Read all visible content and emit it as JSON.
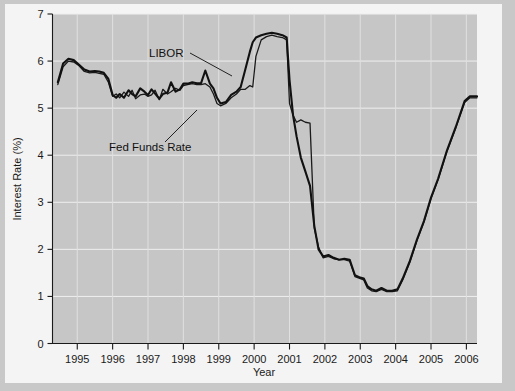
{
  "chart_data": {
    "type": "line",
    "title": "",
    "xlabel": "Year",
    "ylabel": "Interest Rate (%)",
    "xlim": [
      1994.3,
      2006.3
    ],
    "ylim": [
      0,
      7
    ],
    "grid": true,
    "legend_position": "inline-annotations",
    "x_ticks": [
      1995,
      1996,
      1997,
      1998,
      1999,
      2000,
      2001,
      2002,
      2003,
      2004,
      2005,
      2006
    ],
    "x_tick_labels": [
      "1995",
      "1996",
      "1997",
      "1998",
      "1999",
      "2000",
      "2001",
      "2002",
      "2003",
      "2004",
      "2005",
      "2006"
    ],
    "y_ticks": [
      0,
      1,
      2,
      3,
      4,
      5,
      6,
      7
    ],
    "y_tick_labels": [
      "0",
      "1",
      "2",
      "3",
      "4",
      "5",
      "6",
      "7"
    ],
    "annotations": [
      {
        "text": "LIBOR",
        "x": 1997.9,
        "y": 6.27
      },
      {
        "text": "Fed Funds Rate",
        "x": 1996.5,
        "y": 4.43
      }
    ],
    "series": [
      {
        "name": "LIBOR",
        "color": "#111111",
        "x": [
          1994.45,
          1994.6,
          1994.75,
          1994.9,
          1995.05,
          1995.2,
          1995.35,
          1995.5,
          1995.62,
          1995.75,
          1995.88,
          1996.0,
          1996.1,
          1996.2,
          1996.32,
          1996.45,
          1996.55,
          1996.65,
          1996.78,
          1996.9,
          1997.0,
          1997.1,
          1997.2,
          1997.32,
          1997.42,
          1997.55,
          1997.65,
          1997.78,
          1997.9,
          1998.0,
          1998.12,
          1998.25,
          1998.38,
          1998.5,
          1998.62,
          1998.75,
          1998.85,
          1998.95,
          1999.05,
          1999.2,
          1999.35,
          1999.5,
          1999.62,
          1999.75,
          1999.88,
          1999.96,
          2000.05,
          2000.2,
          2000.35,
          2000.5,
          2000.65,
          2000.8,
          2000.92,
          2001.0,
          2001.1,
          2001.2,
          2001.32,
          2001.45,
          2001.58,
          2001.7,
          2001.82,
          2001.95,
          2002.1,
          2002.25,
          2002.4,
          2002.55,
          2002.7,
          2002.85,
          2003.0,
          2003.1,
          2003.2,
          2003.32,
          2003.45,
          2003.6,
          2003.75,
          2003.9,
          2004.05,
          2004.2,
          2004.4,
          2004.6,
          2004.8,
          2005.0,
          2005.2,
          2005.45,
          2005.7,
          2005.95,
          2006.1,
          2006.2,
          2006.3
        ],
        "y": [
          5.55,
          5.95,
          6.05,
          6.02,
          5.92,
          5.82,
          5.78,
          5.79,
          5.78,
          5.75,
          5.62,
          5.28,
          5.22,
          5.3,
          5.22,
          5.38,
          5.3,
          5.25,
          5.42,
          5.35,
          5.28,
          5.4,
          5.31,
          5.2,
          5.3,
          5.33,
          5.55,
          5.35,
          5.4,
          5.52,
          5.52,
          5.55,
          5.53,
          5.53,
          5.8,
          5.52,
          5.42,
          5.22,
          5.1,
          5.13,
          5.28,
          5.35,
          5.45,
          5.82,
          6.2,
          6.4,
          6.5,
          6.55,
          6.58,
          6.6,
          6.58,
          6.55,
          6.5,
          5.6,
          4.85,
          4.4,
          3.95,
          3.65,
          3.35,
          2.5,
          2.0,
          1.85,
          1.88,
          1.82,
          1.78,
          1.8,
          1.78,
          1.45,
          1.4,
          1.38,
          1.22,
          1.15,
          1.12,
          1.18,
          1.12,
          1.12,
          1.15,
          1.38,
          1.75,
          2.2,
          2.6,
          3.1,
          3.5,
          4.1,
          4.6,
          5.15,
          5.25,
          5.25,
          5.25
        ]
      },
      {
        "name": "Fed Funds Rate",
        "color": "#1a1a1a",
        "x": [
          1994.45,
          1994.6,
          1994.75,
          1994.9,
          1995.05,
          1995.2,
          1995.35,
          1995.5,
          1995.62,
          1995.75,
          1995.88,
          1996.0,
          1996.1,
          1996.2,
          1996.32,
          1996.45,
          1996.55,
          1996.65,
          1996.78,
          1996.9,
          1997.0,
          1997.1,
          1997.2,
          1997.32,
          1997.42,
          1997.55,
          1997.65,
          1997.78,
          1997.9,
          1998.0,
          1998.12,
          1998.25,
          1998.38,
          1998.5,
          1998.62,
          1998.75,
          1998.85,
          1998.95,
          1999.05,
          1999.2,
          1999.35,
          1999.5,
          1999.62,
          1999.75,
          1999.88,
          1999.96,
          2000.05,
          2000.2,
          2000.35,
          2000.5,
          2000.65,
          2000.8,
          2000.92,
          2001.0,
          2001.1,
          2001.2,
          2001.32,
          2001.45,
          2001.58,
          2001.7,
          2001.82,
          2001.95,
          2002.1,
          2002.25,
          2002.4,
          2002.55,
          2002.7,
          2002.85,
          2003.0,
          2003.1,
          2003.2,
          2003.32,
          2003.45,
          2003.6,
          2003.75,
          2003.9,
          2004.05,
          2004.2,
          2004.4,
          2004.6,
          2004.8,
          2005.0,
          2005.2,
          2005.45,
          2005.7,
          2005.95,
          2006.1,
          2006.2,
          2006.3
        ],
        "y": [
          5.5,
          5.88,
          6.0,
          5.98,
          5.9,
          5.78,
          5.75,
          5.76,
          5.74,
          5.72,
          5.55,
          5.25,
          5.3,
          5.22,
          5.34,
          5.25,
          5.38,
          5.2,
          5.28,
          5.3,
          5.25,
          5.28,
          5.38,
          5.18,
          5.4,
          5.3,
          5.35,
          5.42,
          5.38,
          5.48,
          5.5,
          5.52,
          5.5,
          5.5,
          5.52,
          5.45,
          5.3,
          5.1,
          5.05,
          5.1,
          5.22,
          5.3,
          5.4,
          5.4,
          5.48,
          5.45,
          6.1,
          6.45,
          6.52,
          6.55,
          6.52,
          6.5,
          6.45,
          5.1,
          4.85,
          4.7,
          4.75,
          4.7,
          4.68,
          2.45,
          2.05,
          1.82,
          1.85,
          1.8,
          1.78,
          1.78,
          1.75,
          1.42,
          1.38,
          1.35,
          1.18,
          1.12,
          1.1,
          1.15,
          1.1,
          1.1,
          1.12,
          1.35,
          1.72,
          2.18,
          2.58,
          3.08,
          3.48,
          4.08,
          4.58,
          5.12,
          5.22,
          5.22,
          5.22
        ]
      }
    ]
  }
}
